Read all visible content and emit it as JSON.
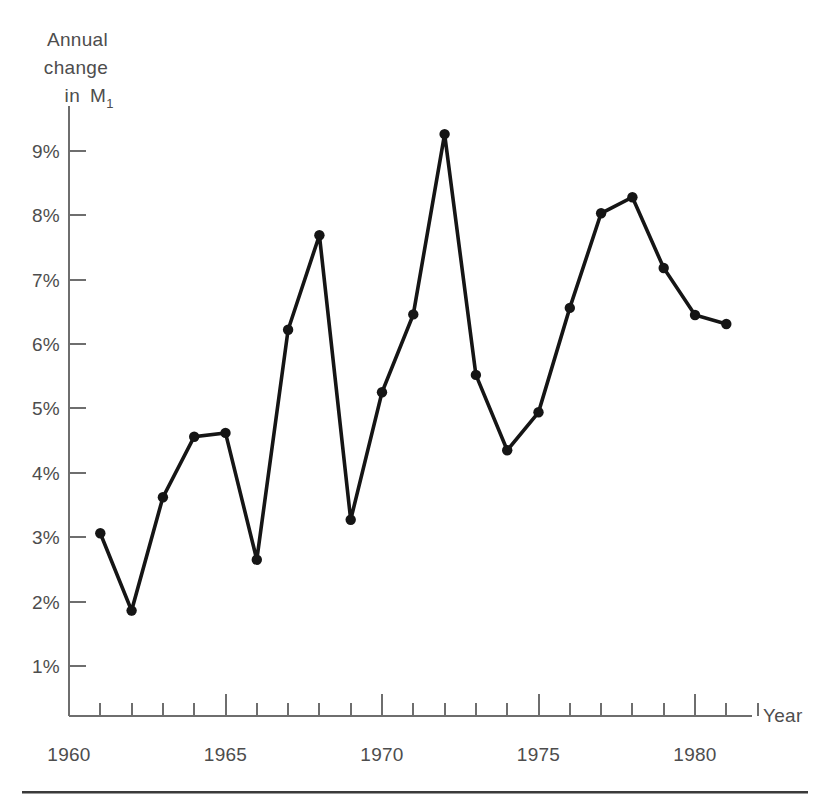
{
  "figure": {
    "y_axis_title_lines": [
      "Annual",
      "change",
      "in"
    ],
    "y_axis_symbol": "M",
    "y_axis_symbol_sub": "1",
    "x_axis_title": "Year"
  },
  "chart_data": {
    "type": "line",
    "title": "",
    "xlabel": "Year",
    "ylabel": "Annual change in M1",
    "xlim": [
      1960,
      1982
    ],
    "ylim": [
      0,
      9.6
    ],
    "grid": false,
    "legend": null,
    "x_tick_labels": [
      "1960",
      "1965",
      "1970",
      "1975",
      "1980"
    ],
    "x_tick_values": [
      1960,
      1965,
      1970,
      1975,
      1980
    ],
    "x_minor_ticks": [
      1961,
      1962,
      1963,
      1964,
      1966,
      1967,
      1968,
      1969,
      1971,
      1972,
      1973,
      1974,
      1976,
      1977,
      1978,
      1979,
      1981,
      1982
    ],
    "y_tick_labels": [
      "1%",
      "2%",
      "3%",
      "4%",
      "5%",
      "6%",
      "7%",
      "8%",
      "9%"
    ],
    "y_tick_values": [
      1,
      2,
      3,
      4,
      5,
      6,
      7,
      8,
      9
    ],
    "marker": "filled-circle",
    "line_color": "#151515",
    "axis_color": "#6e6e6e",
    "x": [
      1961,
      1962,
      1963,
      1964,
      1965,
      1966,
      1967,
      1968,
      1969,
      1970,
      1971,
      1972,
      1973,
      1974,
      1975,
      1976,
      1977,
      1978,
      1979,
      1980,
      1981
    ],
    "values": [
      3.06,
      1.86,
      3.62,
      4.56,
      4.62,
      2.65,
      6.22,
      7.69,
      3.27,
      5.25,
      6.46,
      9.26,
      5.52,
      4.35,
      4.94,
      6.56,
      8.03,
      8.28,
      7.18,
      6.45,
      6.31
    ],
    "series": [
      {
        "name": "Annual change in M1",
        "values": [
          3.06,
          1.86,
          3.62,
          4.56,
          4.62,
          2.65,
          6.22,
          7.69,
          3.27,
          5.25,
          6.46,
          9.26,
          5.52,
          4.35,
          4.94,
          6.56,
          8.03,
          8.28,
          7.18,
          6.45,
          6.31
        ]
      }
    ]
  }
}
